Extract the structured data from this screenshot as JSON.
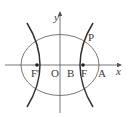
{
  "diagram": {
    "type": "conic-sections",
    "axes": {
      "x_label": "x",
      "y_label": "y"
    },
    "points": {
      "origin": "O",
      "left_focus": "F'",
      "right_focus": "F",
      "hyperbola_vertex": "B",
      "ellipse_vertex": "A",
      "intersection": "P"
    },
    "colors": {
      "curve": "#333333",
      "axis": "#555555",
      "ellipse": "#555555",
      "text": "#3a3a3a"
    }
  }
}
